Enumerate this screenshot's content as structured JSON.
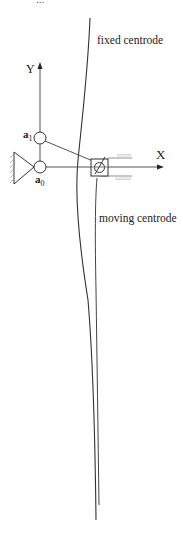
{
  "figure": {
    "top_caption_fragment": "...",
    "labels": {
      "fixed_centrode": "fixed centrode",
      "moving_centrode": "moving centrode",
      "y_axis": "Y",
      "x_axis": "X",
      "joint_a1": "a",
      "joint_a1_sub": "1",
      "joint_a0": "a",
      "joint_a0_sub": "0"
    },
    "colors": {
      "line": "#333333",
      "light": "#999999",
      "background": "#ffffff"
    }
  }
}
